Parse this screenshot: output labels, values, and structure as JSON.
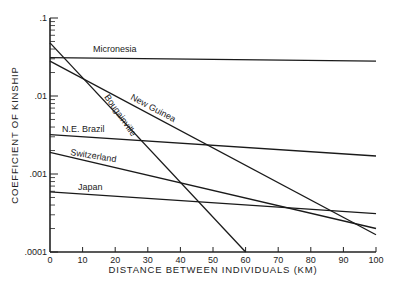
{
  "chart_data": {
    "type": "line",
    "title": "",
    "xlabel": "DISTANCE BETWEEN INDIVIDUALS (KM)",
    "ylabel": "COEFFICIENT OF KINSHIP",
    "yscale": "log",
    "xlim": [
      0,
      100
    ],
    "ylim": [
      0.0001,
      0.1
    ],
    "x_ticks": [
      0,
      10,
      20,
      30,
      40,
      50,
      60,
      70,
      80,
      90,
      100
    ],
    "x_tick_labels": [
      "0",
      "10",
      "20",
      "30",
      "40",
      "50",
      "60",
      "70",
      "80",
      "90",
      "100"
    ],
    "y_ticks": [
      0.1,
      0.01,
      0.001,
      0.0001
    ],
    "y_tick_labels": [
      ".1",
      ".01",
      ".001",
      ".0001"
    ],
    "grid": false,
    "legend": "inline labels",
    "series": [
      {
        "name": "Micronesia",
        "x": [
          0,
          100
        ],
        "values": [
          0.031,
          0.028
        ],
        "label_pos": {
          "x": 93,
          "y": 52,
          "rotate": 0
        }
      },
      {
        "name": "New Guinea",
        "x": [
          0,
          100
        ],
        "values": [
          0.028,
          0.000166
        ],
        "label_pos": {
          "x": 130,
          "y": 99,
          "rotate": 28
        }
      },
      {
        "name": "Bougainville",
        "x": [
          0,
          60
        ],
        "values": [
          0.048,
          0.0001
        ],
        "label_pos": {
          "x": 104,
          "y": 97,
          "rotate": 55
        }
      },
      {
        "name": "N.E. Brazil",
        "x": [
          0,
          100
        ],
        "values": [
          0.0032,
          0.0017
        ],
        "label_pos": {
          "x": 62,
          "y": 132,
          "rotate": 0
        }
      },
      {
        "name": "Switzerland",
        "x": [
          0,
          100
        ],
        "values": [
          0.0019,
          0.0002
        ],
        "label_pos": {
          "x": 70,
          "y": 155,
          "rotate": 9
        }
      },
      {
        "name": "Japan",
        "x": [
          0,
          100
        ],
        "values": [
          0.00059,
          0.00031
        ],
        "label_pos": {
          "x": 78,
          "y": 190,
          "rotate": 0
        }
      }
    ]
  }
}
